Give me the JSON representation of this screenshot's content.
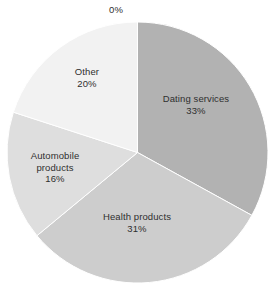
{
  "chart_data": {
    "type": "pie",
    "title": "",
    "subtitle": "",
    "xlabel": "",
    "ylabel": "",
    "legend": "none",
    "grid": false,
    "start_angle_deg": 0,
    "direction": "clockwise",
    "labels_position": "inside",
    "background_color": "#ffffff",
    "label_text_color": "#2f2f2f",
    "categories": [
      "",
      "Dating services",
      "Health products",
      "Automobile products",
      "Other"
    ],
    "values": [
      0,
      33,
      31,
      16,
      20
    ],
    "value_labels": [
      "0%",
      "33%",
      "31%",
      "16%",
      "20%"
    ],
    "colors": [
      "#ffffff",
      "#b2b2b2",
      "#cdcdcd",
      "#dedede",
      "#f2f2f2"
    ],
    "slices": [
      {
        "name": "",
        "label_lines": [
          ""
        ],
        "value": 0,
        "value_label": "0%",
        "color": "#ffffff",
        "start_deg": 0,
        "end_deg": 0
      },
      {
        "name": "Dating services",
        "label_lines": [
          "Dating services"
        ],
        "value": 33,
        "value_label": "33%",
        "color": "#b2b2b2",
        "start_deg": 0,
        "end_deg": 118.8
      },
      {
        "name": "Health products",
        "label_lines": [
          "Health products"
        ],
        "value": 31,
        "value_label": "31%",
        "color": "#cdcdcd",
        "start_deg": 118.8,
        "end_deg": 230.4
      },
      {
        "name": "Automobile products",
        "label_lines": [
          "Automobile",
          "products"
        ],
        "value": 16,
        "value_label": "16%",
        "color": "#dedede",
        "start_deg": 230.4,
        "end_deg": 288.0
      },
      {
        "name": "Other",
        "label_lines": [
          "Other"
        ],
        "value": 20,
        "value_label": "20%",
        "color": "#f2f2f2",
        "start_deg": 288.0,
        "end_deg": 360.0
      }
    ]
  },
  "labels": {
    "zero": {
      "value": "0%"
    },
    "dating": {
      "name": "Dating services",
      "value": "33%"
    },
    "health": {
      "name": "Health products",
      "value": "31%"
    },
    "automobile": {
      "line1": "Automobile",
      "line2": "products",
      "value": "16%"
    },
    "other": {
      "name": "Other",
      "value": "20%"
    }
  }
}
